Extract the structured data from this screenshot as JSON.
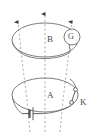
{
  "figure": {
    "type": "physics-circuit-diagram",
    "width": 95,
    "height": 133,
    "background": "#ffffff",
    "stroke_color": "#6e6e6e",
    "dash_color": "#8d8d8d",
    "label_color": "#4a4a4a"
  },
  "labels": {
    "coil_b": "B",
    "coil_a": "A",
    "galvanometer": "G",
    "switch": "K"
  },
  "icons": {
    "arrowhead": "field-line-arrowhead",
    "battery": "battery-cell-symbol",
    "switch": "open-switch-symbol",
    "galvanometer": "galvanometer-circle"
  },
  "elements": {
    "upper_coil": {
      "name": "B",
      "cx": 45,
      "cy": 40,
      "rx": 33,
      "ry": 17
    },
    "lower_coil": {
      "name": "A",
      "cx": 45,
      "cy": 95,
      "rx": 33,
      "ry": 17
    },
    "galvanometer_circle": {
      "cx": 72,
      "cy": 37,
      "r": 8
    },
    "field_lines": [
      {
        "id": "left",
        "x_top": 16,
        "x_bottom": 32,
        "arrow": true
      },
      {
        "id": "center",
        "x_top": 45,
        "x_bottom": 45,
        "arrow": true
      },
      {
        "id": "right",
        "x_top": 74,
        "x_bottom": 58,
        "arrow": true
      }
    ],
    "field_line_direction": "upward"
  }
}
